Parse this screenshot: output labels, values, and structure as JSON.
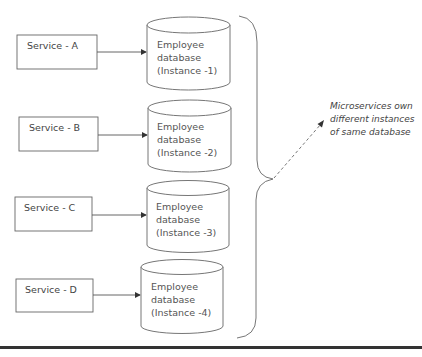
{
  "diagram": {
    "services": [
      {
        "label": "Service - A"
      },
      {
        "label": "Service - B"
      },
      {
        "label": "Service - C"
      },
      {
        "label": "Service - D"
      }
    ],
    "databases": [
      {
        "lines": [
          "Employee",
          "database",
          "(Instance -1)"
        ]
      },
      {
        "lines": [
          "Employee",
          "database",
          "(Instance -2)"
        ]
      },
      {
        "lines": [
          "Employee",
          "database",
          "(Instance -3)"
        ]
      },
      {
        "lines": [
          "Employee",
          "database",
          "(Instance -4)"
        ]
      }
    ],
    "annotation": {
      "lines": [
        "Microservices own",
        "different instances",
        "of same database"
      ]
    },
    "colors": {
      "stroke": "#555555",
      "text": "#444444",
      "bottom_rule": "#333333"
    }
  }
}
